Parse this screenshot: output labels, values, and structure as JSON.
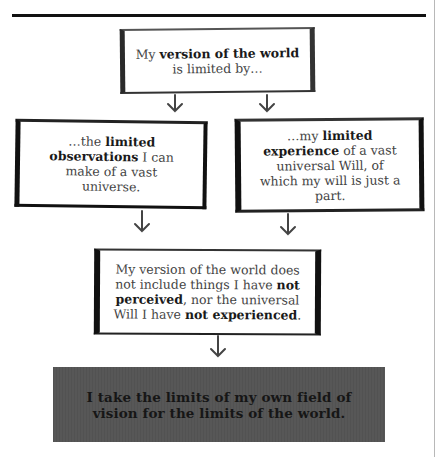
{
  "page": {
    "rule": "horizontal-rule",
    "colors": {
      "rule": "#111111",
      "box_border": "#111111",
      "body_text": "#444444",
      "bold_text": "#1a1a1a",
      "conclusion_bg": "#575757",
      "conclusion_text": "#161616"
    }
  },
  "diagram": {
    "top_box": {
      "line1_pre": "My ",
      "line1_bold": "version of the world",
      "line2": "is limited by…"
    },
    "left_box": {
      "pre": "…the ",
      "bold1": "limited observations",
      "post": " I can make of a vast universe."
    },
    "right_box": {
      "pre": "…my ",
      "bold1": "limited experience",
      "post": " of a vast universal Will, of which my will is just a part."
    },
    "bottom_box": {
      "pre": "My version of the world does not include things I have ",
      "bold1": "not perceived",
      "mid": ", nor the universal Will I have ",
      "bold2": "not experienced",
      "post": "."
    },
    "conclusion": {
      "text": "I take the limits of my own field of vision for the limits of the world."
    },
    "arrows": [
      {
        "from": "top_box",
        "to": "left_box",
        "icon": "arrow-down-icon"
      },
      {
        "from": "top_box",
        "to": "right_box",
        "icon": "arrow-down-icon"
      },
      {
        "from": "left_box",
        "to": "bottom_box",
        "icon": "arrow-down-icon"
      },
      {
        "from": "right_box",
        "to": "bottom_box",
        "icon": "arrow-down-icon"
      },
      {
        "from": "bottom_box",
        "to": "conclusion",
        "icon": "arrow-down-icon"
      }
    ]
  }
}
